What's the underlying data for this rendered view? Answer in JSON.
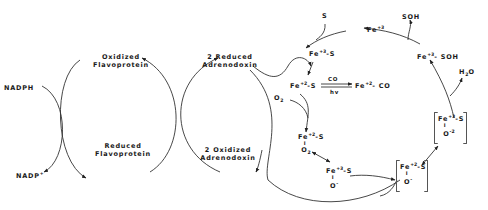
{
  "diagram": {
    "type": "reaction-cycle",
    "left_cycle": {
      "nadph": "NADPH",
      "nadp_plus": "NADP",
      "nadp_plus_sup": "+"
    },
    "flavoprotein_cycle": {
      "oxidized_line1": "Oxidized",
      "oxidized_line2": "Flavoprotein",
      "reduced_line1": "Reduced",
      "reduced_line2": "Flavoprotein"
    },
    "adrenodoxin_cycle": {
      "reduced_line1": "2 Reduced",
      "reduced_line2": "Adrenodoxin",
      "oxidized_line1": "2 Oxidized",
      "oxidized_line2": "Adrenodoxin"
    },
    "p450_cycle": {
      "substrate": "S",
      "product": "SOH",
      "fe3": {
        "base": "Fe",
        "sup": "+3"
      },
      "fe3_s": {
        "base": "Fe",
        "sup": "+3",
        "suffix": "-S"
      },
      "fe3_soh": {
        "base": "Fe",
        "sup": "+3",
        "suffix": "- SOH"
      },
      "fe2_s": {
        "base": "Fe",
        "sup": "+2",
        "suffix": "-S"
      },
      "co_label": "CO",
      "hv_label": "hv",
      "fe2_co": {
        "base": "Fe",
        "sup": "+2",
        "suffix": "- CO"
      },
      "o2_input": {
        "base": "O",
        "sub": "2"
      },
      "fe2_s_o2": {
        "base": "Fe",
        "sup": "+2",
        "suffix": "-S",
        "bond": "I",
        "ligand": "O",
        "ligand_sub": "2"
      },
      "fe3_s_o2minus": {
        "base": "Fe",
        "sup": "+3",
        "suffix": "-S",
        "bond": "I",
        "ligand": "O",
        "ligand_sup": "-",
        "ligand_sub": "2"
      },
      "bracket_fe2_s_o2minus": {
        "base": "Fe",
        "sup": "+2",
        "suffix": "-S",
        "bond": "I",
        "ligand": "O",
        "ligand_sup": "-",
        "ligand_sub": "2"
      },
      "bracket_fe3_s_o2_2minus": {
        "base": "Fe",
        "sup": "+3",
        "suffix": "-S",
        "bond": "I",
        "ligand": "O",
        "ligand_sup": "-2",
        "ligand_sub": "2"
      },
      "water": {
        "base": "H",
        "sub": "2",
        "suffix": "O"
      }
    }
  }
}
